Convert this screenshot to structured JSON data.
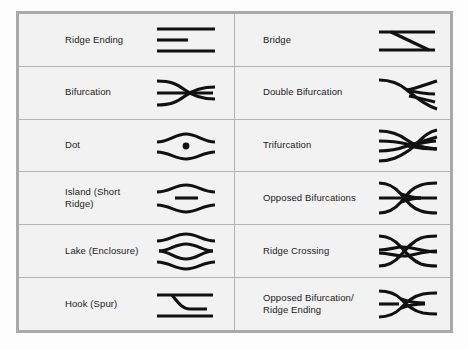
{
  "figure": {
    "caption": "",
    "border_color": "#a9a9a9",
    "grid_color": "#b3b3b3",
    "cell_background": "#f2f2f2",
    "ink_color": "#111111"
  },
  "table": {
    "columns": 2,
    "rows": 6,
    "entries": [
      {
        "label": "Ridge Ending",
        "icon": "ridge-ending-icon",
        "column": 0,
        "row": 0
      },
      {
        "label": "Bridge",
        "icon": "bridge-icon",
        "column": 1,
        "row": 0
      },
      {
        "label": "Bifurcation",
        "icon": "bifurcation-icon",
        "column": 0,
        "row": 1
      },
      {
        "label": "Double Bifurcation",
        "icon": "double-bifurcation-icon",
        "column": 1,
        "row": 1
      },
      {
        "label": "Dot",
        "icon": "dot-icon",
        "column": 0,
        "row": 2
      },
      {
        "label": "Trifurcation",
        "icon": "trifurcation-icon",
        "column": 1,
        "row": 2
      },
      {
        "label": "Island (Short Ridge)",
        "icon": "island-short-ridge-icon",
        "column": 0,
        "row": 3
      },
      {
        "label": "Opposed Bifurcations",
        "icon": "opposed-bifurcations-icon",
        "column": 1,
        "row": 3
      },
      {
        "label": "Lake (Enclosure)",
        "icon": "lake-enclosure-icon",
        "column": 0,
        "row": 4
      },
      {
        "label": "Ridge Crossing",
        "icon": "ridge-crossing-icon",
        "column": 1,
        "row": 4
      },
      {
        "label": "Hook (Spur)",
        "icon": "hook-spur-icon",
        "column": 0,
        "row": 5
      },
      {
        "label": "Opposed Bifurcation/ Ridge Ending",
        "icon": "opposed-bifurcation-ridge-ending-icon",
        "column": 1,
        "row": 5
      }
    ]
  }
}
